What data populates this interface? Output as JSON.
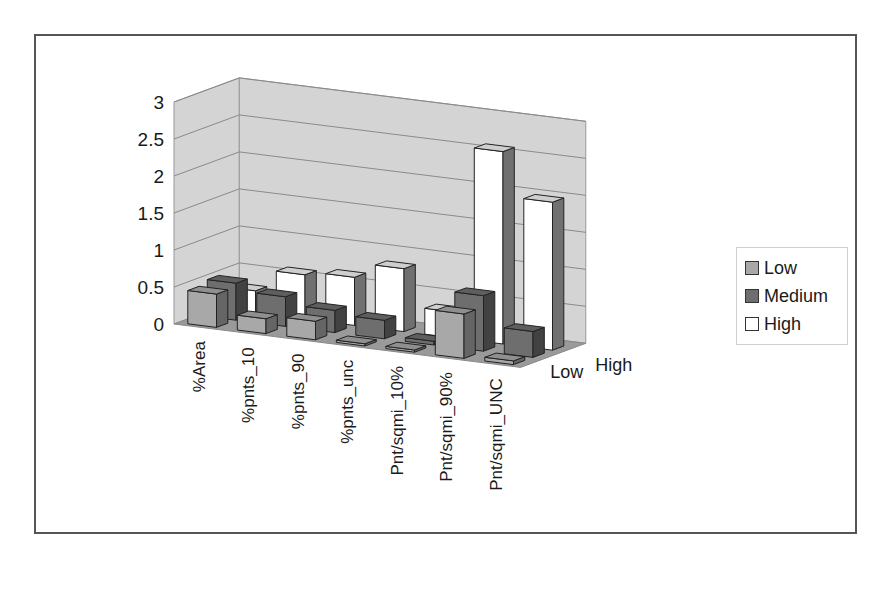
{
  "chart_data": {
    "type": "bar",
    "subtype": "3d-column",
    "title": "",
    "xlabel": "",
    "ylabel": "",
    "categories": [
      "%Area",
      "%pnts_10",
      "%pnts_90",
      "%pnts_unc",
      "Pnt/sqmi_10%",
      "Pnt/sqmi_90%",
      "Pnt/sqmi_UNC"
    ],
    "series": [
      {
        "name": "Low",
        "color": "#a8a8a8",
        "values": [
          0.45,
          0.2,
          0.25,
          0.03,
          0.03,
          0.6,
          0.05
        ]
      },
      {
        "name": "Medium",
        "color": "#6e6e6e",
        "values": [
          0.5,
          0.4,
          0.3,
          0.25,
          0.05,
          0.75,
          0.35
        ]
      },
      {
        "name": "High",
        "color": "#ffffff",
        "values": [
          0.3,
          0.6,
          0.65,
          0.85,
          0.35,
          2.6,
          2.0
        ]
      }
    ],
    "ylim": [
      0,
      3
    ],
    "yticks": [
      "0",
      "0.5",
      "1",
      "1.5",
      "2",
      "2.5",
      "3"
    ],
    "depth_axis_labels": [
      "Low",
      "High"
    ],
    "grid": true,
    "legend_position": "right"
  },
  "legend": {
    "items": [
      {
        "label": "Low",
        "color": "#a8a8a8"
      },
      {
        "label": "Medium",
        "color": "#6e6e6e"
      },
      {
        "label": "High",
        "color": "#ffffff"
      }
    ]
  },
  "colors": {
    "wall": "#d4d4d4",
    "floor": "#9a9a9a",
    "gridline": "#8a8a8a",
    "frame": "#555555"
  }
}
